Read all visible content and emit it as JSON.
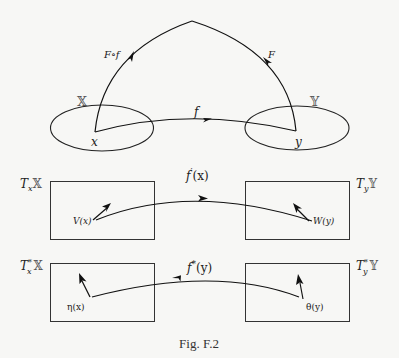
{
  "figure": {
    "caption": "Fig. F.2",
    "top_diagram": {
      "sets": [
        {
          "name": "X",
          "glyph": "𝕏"
        },
        {
          "name": "Y",
          "glyph": "𝕐"
        }
      ],
      "points": {
        "x": "x",
        "y": "y"
      },
      "maps": {
        "f": "f",
        "F": "F",
        "composite": "F∘f"
      }
    },
    "tangent_row": {
      "left_space": {
        "T": "T",
        "sub": "x",
        "set": "𝕏"
      },
      "right_space": {
        "T": "T",
        "sub": "y",
        "set": "𝕐"
      },
      "map_label": {
        "f": "f",
        "prime": "′",
        "arg": "(x)"
      },
      "left_vector": "V(x)",
      "right_vector": "W(y)"
    },
    "cotangent_row": {
      "left_space": {
        "T": "T",
        "star": "*",
        "sub": "x",
        "set": "𝕏"
      },
      "right_space": {
        "T": "T",
        "star": "*",
        "sub": "y",
        "set": "𝕐"
      },
      "map_label": {
        "f": "f",
        "star": "*",
        "arg": "(y)"
      },
      "left_covector": "η(x)",
      "right_covector": "θ(y)"
    }
  }
}
